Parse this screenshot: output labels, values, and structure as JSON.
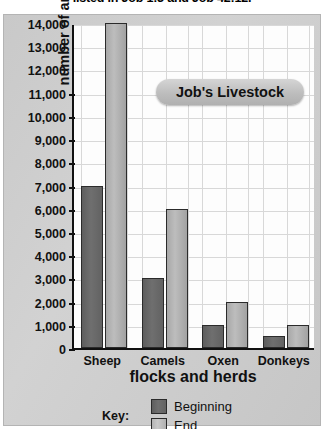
{
  "top_text": "listed in Job 1:3 and Job 42:12.",
  "chart_data": {
    "type": "bar",
    "title": "Job's Livestock",
    "xlabel": "flocks and herds",
    "ylabel": "number of animals",
    "categories": [
      "Sheep",
      "Camels",
      "Oxen",
      "Donkeys"
    ],
    "series": [
      {
        "name": "Beginning",
        "values": [
          7000,
          3000,
          1000,
          500
        ],
        "color": "#6a6a6a"
      },
      {
        "name": "End",
        "values": [
          14000,
          6000,
          2000,
          1000
        ],
        "color": "#b8b8b8"
      }
    ],
    "ylim": [
      0,
      14000
    ],
    "ytick_step": 1000,
    "ytick_labels": [
      "0",
      "1,000",
      "2,000",
      "3,000",
      "4,000",
      "5,000",
      "6,000",
      "7,000",
      "8,000",
      "9,000",
      "10,000",
      "11,000",
      "12,000",
      "13,000",
      "14,000"
    ],
    "grid": true,
    "legend_position": "bottom",
    "legend_title": "Key:"
  }
}
